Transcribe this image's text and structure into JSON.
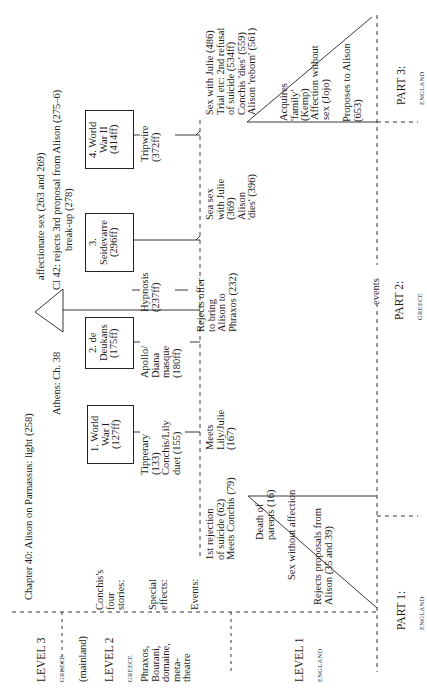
{
  "diagram": {
    "levels": [
      {
        "label": "LEVEL 3",
        "sublabel": "GREECE",
        "note": "(mainland)"
      },
      {
        "label": "LEVEL 2",
        "sublabel": "GREECE",
        "note": "Phraxos,\nBourani,\ndomaine,\nmeta-\ntheatre"
      },
      {
        "label": "LEVEL 1",
        "sublabel": "ENGLAND"
      }
    ],
    "level3_events": {
      "chapter40": "Chapter 40: Alison on Parnassus: light (258)",
      "affectionate": "affectionate sex (263 and 269)",
      "athens": "Athens: Ch. 38",
      "ch42": "Cl  42: rejects 3rd proposal from Alison (275–6)",
      "breakup": "break-up (278)"
    },
    "row_labels": {
      "stories": "Conchis's\nfour\nstories:",
      "effects": "Special\neffects:",
      "events": "Events:"
    },
    "stories": [
      {
        "label": "1. World\nWar I\n(127ff)"
      },
      {
        "label": "2. de\nDeukans\n(175ff)"
      },
      {
        "label": "3.\nSeidevarre\n(296ff)"
      },
      {
        "label": "4. World\nWar II\n(414ff)"
      }
    ],
    "special_effects": [
      "Tipperary\n(133)\nConchis/Lily\nduet (155)",
      "Apollo/\nDiana\nmasque\n(180ff)",
      "Hypnosis\n(237ff)",
      "Tripwire\n(372ff)"
    ],
    "events": [
      "1st rejection\nof suicide (62)\nMeets Conchis (79)",
      "Meets\nLily/Julie\n(167)",
      "Rejects offer\nto bring\nAlison to\nPhraxos (232)",
      "Sea sex\nwith Julie\n(369)\nAlison\n'dies' (396)",
      "Sex with Julie (486)\nTrial etc: 2nd refusal\nof suicide (534ff)\nConchis 'dies' (559)\nAlison 'reborn' (561)"
    ],
    "part1_events": [
      "Death of\nparents (16)",
      "Sex without affection",
      "Rejects proposals from\nAlison (35 and 39)"
    ],
    "part3_events": [
      "Acquires\n'family' (Kemp)",
      "Affection without\nsex (Jojo)",
      "Proposes to Alison\n(653)"
    ],
    "events_axis_label": "events",
    "parts": [
      {
        "label": "PART 1:",
        "sublabel": "ENGLAND"
      },
      {
        "label": "PART 2:",
        "sublabel": "GREECE"
      },
      {
        "label": "PART 3:",
        "sublabel": "ENGLAND"
      }
    ]
  }
}
